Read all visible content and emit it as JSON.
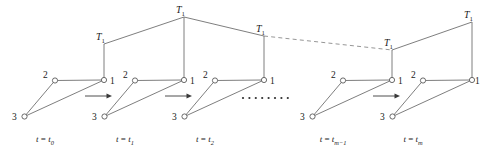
{
  "figure": {
    "type": "diagram",
    "width": 482,
    "height": 154,
    "background_color": "#ffffff",
    "line_color": "#6f6f6f",
    "text_color": "#1a1a1a"
  },
  "node_labels": {
    "bus1": "1",
    "bus2": "2",
    "bus3": "3"
  },
  "load_label": {
    "symbol": "T",
    "subscript": "1"
  },
  "ellipsis": {
    "dot_count": 8,
    "dot_radius": 1.1
  },
  "units": [
    {
      "id": "unit-t0",
      "time_label": {
        "prefix": "t",
        "equals": " = ",
        "base": "t",
        "sub": "0"
      },
      "nodes": {
        "n1": {
          "x": 104,
          "y": 80
        },
        "n2": {
          "x": 55,
          "y": 80.5
        },
        "n3": {
          "x": 24.5,
          "y": 116.5
        }
      },
      "label_pos": {
        "n1": {
          "x": 110,
          "y": 84
        },
        "n2": {
          "x": 43,
          "y": 78
        },
        "n3": {
          "x": 12,
          "y": 120
        }
      },
      "load_anchor": {
        "x": 104,
        "y": 44
      },
      "load_text": {
        "x": 96,
        "y": 40
      },
      "time_text": {
        "x": 45,
        "y": 142
      },
      "has_arrow_after": true,
      "arrow": {
        "x1": 85,
        "x2": 112,
        "y": 96
      }
    },
    {
      "id": "unit-t1",
      "time_label": {
        "prefix": "t",
        "equals": " = ",
        "base": "t",
        "sub": "1"
      },
      "nodes": {
        "n1": {
          "x": 184,
          "y": 80
        },
        "n2": {
          "x": 135,
          "y": 80.5
        },
        "n3": {
          "x": 104.5,
          "y": 116.5
        }
      },
      "label_pos": {
        "n1": {
          "x": 190,
          "y": 84
        },
        "n2": {
          "x": 123,
          "y": 78
        },
        "n3": {
          "x": 92,
          "y": 120
        }
      },
      "load_anchor": {
        "x": 184,
        "y": 17
      },
      "load_text": {
        "x": 176,
        "y": 13
      },
      "time_text": {
        "x": 125,
        "y": 142
      },
      "has_arrow_after": true,
      "arrow": {
        "x1": 165,
        "x2": 192,
        "y": 96
      }
    },
    {
      "id": "unit-t2",
      "time_label": {
        "prefix": "t",
        "equals": " = ",
        "base": "t",
        "sub": "2"
      },
      "nodes": {
        "n1": {
          "x": 264,
          "y": 80
        },
        "n2": {
          "x": 215,
          "y": 80.5
        },
        "n3": {
          "x": 184.5,
          "y": 116.5
        }
      },
      "label_pos": {
        "n1": {
          "x": 270,
          "y": 84
        },
        "n2": {
          "x": 203,
          "y": 78
        },
        "n3": {
          "x": 172,
          "y": 120
        }
      },
      "load_anchor": {
        "x": 264,
        "y": 36
      },
      "load_text": {
        "x": 256,
        "y": 32
      },
      "time_text": {
        "x": 205,
        "y": 142
      },
      "has_arrow_after": false,
      "arrow": null
    },
    {
      "id": "unit-tm-1",
      "time_label": {
        "prefix": "t",
        "equals": " = ",
        "base": "t",
        "sub": "m−1"
      },
      "nodes": {
        "n1": {
          "x": 392,
          "y": 80
        },
        "n2": {
          "x": 343,
          "y": 80.5
        },
        "n3": {
          "x": 312.5,
          "y": 116.5
        }
      },
      "label_pos": {
        "n1": {
          "x": 398,
          "y": 84
        },
        "n2": {
          "x": 331,
          "y": 78
        },
        "n3": {
          "x": 300,
          "y": 120
        }
      },
      "load_anchor": {
        "x": 392,
        "y": 50
      },
      "load_text": {
        "x": 384,
        "y": 46
      },
      "time_text": {
        "x": 333,
        "y": 142
      },
      "has_arrow_after": true,
      "arrow": {
        "x1": 373,
        "x2": 400,
        "y": 96
      }
    },
    {
      "id": "unit-tm",
      "time_label": {
        "prefix": "t",
        "equals": " = ",
        "base": "t",
        "sub": "m"
      },
      "nodes": {
        "n1": {
          "x": 472,
          "y": 80
        },
        "n2": {
          "x": 423,
          "y": 80.5
        },
        "n3": {
          "x": 392.5,
          "y": 116.5
        }
      },
      "label_pos": {
        "n1": {
          "x": 475,
          "y": 84
        },
        "n2": {
          "x": 411,
          "y": 78
        },
        "n3": {
          "x": 380,
          "y": 120
        }
      },
      "load_anchor": {
        "x": 472,
        "y": 22
      },
      "load_text": {
        "x": 464,
        "y": 18
      },
      "time_text": {
        "x": 413,
        "y": 142
      },
      "has_arrow_after": false,
      "arrow": null
    }
  ],
  "ridge_segments": [
    {
      "id": "ridge-t0-t1",
      "from": {
        "x": 104,
        "y": 44
      },
      "to": {
        "x": 184,
        "y": 17
      },
      "style": "solid"
    },
    {
      "id": "ridge-t1-t2",
      "from": {
        "x": 184,
        "y": 17
      },
      "to": {
        "x": 264,
        "y": 36
      },
      "style": "solid"
    },
    {
      "id": "ridge-t2-tm-1",
      "from": {
        "x": 264,
        "y": 36
      },
      "to": {
        "x": 392,
        "y": 50
      },
      "style": "dashed"
    },
    {
      "id": "ridge-tm-1-tm",
      "from": {
        "x": 392,
        "y": 50
      },
      "to": {
        "x": 472,
        "y": 22
      },
      "style": "solid"
    }
  ],
  "ellipsis_pos": {
    "y": 98,
    "x_start": 243,
    "x_step": 6.4
  }
}
